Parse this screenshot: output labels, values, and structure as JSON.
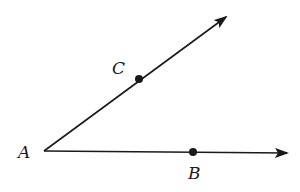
{
  "diagram": {
    "type": "angle",
    "colors": {
      "stroke": "#1a1a1a",
      "background": "#ffffff"
    },
    "vertex": {
      "label": "A",
      "x": 44,
      "y": 151,
      "label_x": 18,
      "label_y": 158
    },
    "rays": [
      {
        "name": "ray-AC",
        "from": "A",
        "through": "C",
        "end_x": 226,
        "end_y": 17
      },
      {
        "name": "ray-AB",
        "from": "A",
        "through": "B",
        "end_x": 287,
        "end_y": 153
      }
    ],
    "points": [
      {
        "label": "C",
        "x": 139,
        "y": 79,
        "label_x": 112,
        "label_y": 74
      },
      {
        "label": "B",
        "x": 193,
        "y": 152,
        "label_x": 188,
        "label_y": 179
      }
    ]
  }
}
